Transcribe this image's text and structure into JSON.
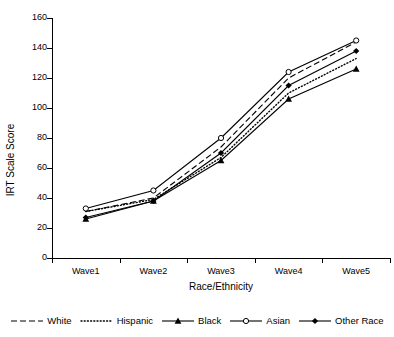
{
  "chart_data": {
    "type": "line",
    "title": "",
    "xlabel": "Race/Ethnicity",
    "ylabel": "IRT Scale Score",
    "categories": [
      "Wave1",
      "Wave2",
      "Wave3",
      "Wave4",
      "Wave5"
    ],
    "ylim": [
      0,
      160
    ],
    "y_ticks": [
      0,
      20,
      40,
      60,
      80,
      100,
      120,
      140,
      160
    ],
    "grid": false,
    "legend_position": "bottom",
    "series": [
      {
        "name": "White",
        "values": [
          31,
          40,
          74,
          120,
          144
        ],
        "line_style": "dashed",
        "marker": "none",
        "color": "#000000"
      },
      {
        "name": "Hispanic",
        "values": [
          31,
          39,
          67,
          110,
          133
        ],
        "line_style": "dotted",
        "marker": "none",
        "color": "#000000"
      },
      {
        "name": "Black",
        "values": [
          26,
          38,
          65,
          106,
          126
        ],
        "line_style": "solid",
        "marker": "filled-triangle",
        "color": "#000000"
      },
      {
        "name": "Asian",
        "values": [
          33,
          45,
          80,
          124,
          145
        ],
        "line_style": "solid",
        "marker": "open-circle",
        "color": "#000000"
      },
      {
        "name": "Other Race",
        "values": [
          27,
          38,
          70,
          115,
          138
        ],
        "line_style": "solid",
        "marker": "filled-diamond",
        "color": "#000000"
      }
    ]
  },
  "axes": {
    "y_tick_labels": [
      "160",
      "140",
      "120",
      "100",
      "80",
      "60",
      "40",
      "20",
      "0"
    ],
    "y_title": "IRT Scale Score",
    "x_title": "Race/Ethnicity",
    "x_tick_labels": [
      "Wave1",
      "Wave2",
      "Wave3",
      "Wave4",
      "Wave5"
    ]
  },
  "legend": {
    "items": [
      {
        "label": "White",
        "style": "dashed",
        "marker": "none"
      },
      {
        "label": "Hispanic",
        "style": "dotted",
        "marker": "none"
      },
      {
        "label": "Black",
        "style": "solid",
        "marker": "filled-triangle"
      },
      {
        "label": "Asian",
        "style": "solid",
        "marker": "open-circle"
      },
      {
        "label": "Other Race",
        "style": "solid",
        "marker": "filled-diamond"
      }
    ]
  }
}
